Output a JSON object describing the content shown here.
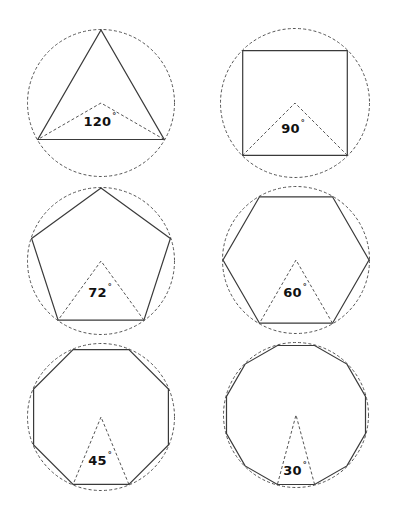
{
  "diagram": {
    "colors": {
      "background": "#ffffff",
      "polygon_stroke": "#3a3a3a",
      "dashed_stroke": "#555555",
      "label_text": "#111111"
    },
    "figures": [
      {
        "name": "triangle",
        "sides": 3,
        "central_angle": "120",
        "degree_symbol": "°",
        "cx": 101,
        "cy": 103,
        "r": 73,
        "label_pos": [
          100,
          121
        ]
      },
      {
        "name": "square",
        "sides": 4,
        "central_angle": "90",
        "degree_symbol": "°",
        "cx": 295,
        "cy": 103,
        "r": 74,
        "label_pos": [
          293,
          128
        ]
      },
      {
        "name": "pentagon",
        "sides": 5,
        "central_angle": "72",
        "degree_symbol": "°",
        "cx": 101,
        "cy": 261,
        "r": 73,
        "label_pos": [
          100,
          292
        ]
      },
      {
        "name": "hexagon",
        "sides": 6,
        "central_angle": "60",
        "degree_symbol": "°",
        "cx": 296,
        "cy": 260,
        "r": 73,
        "label_pos": [
          295,
          292
        ]
      },
      {
        "name": "octagon",
        "sides": 8,
        "central_angle": "45",
        "degree_symbol": "°",
        "cx": 101,
        "cy": 417,
        "r": 73,
        "label_pos": [
          100,
          460
        ]
      },
      {
        "name": "dodecagon",
        "sides": 12,
        "central_angle": "30",
        "degree_symbol": "°",
        "cx": 296,
        "cy": 415,
        "r": 72,
        "label_pos": [
          295,
          470
        ]
      }
    ]
  }
}
